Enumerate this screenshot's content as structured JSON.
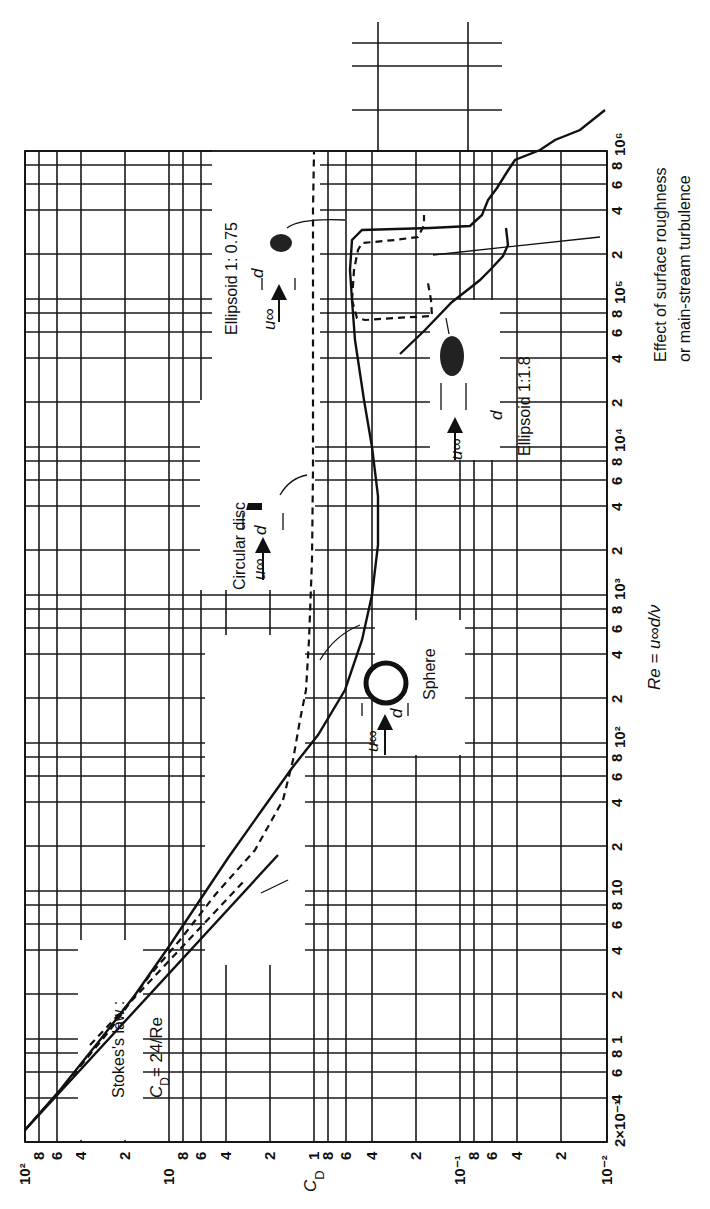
{
  "chart_data": {
    "type": "line",
    "orientation": "rotated-90-ccw",
    "title": "",
    "xlabel": "Re = u∞d/ν",
    "ylabel": "C_D",
    "xscale": "log",
    "yscale": "log",
    "xlim": [
      0.2,
      1000000
    ],
    "ylim": [
      0.01,
      100
    ],
    "grid": true,
    "legend": "none (curves labeled by inline annotations)",
    "x_tick_labels": [
      "2×10⁻¹",
      "4",
      "6",
      "8",
      "1",
      "2",
      "4",
      "6",
      "8",
      "10",
      "2",
      "4",
      "6",
      "8",
      "10²",
      "2",
      "4",
      "6",
      "8",
      "10³",
      "2",
      "4",
      "6",
      "8",
      "10⁴",
      "2",
      "4",
      "6",
      "8",
      "10⁵",
      "2",
      "4",
      "6",
      "8",
      "10⁶"
    ],
    "y_tick_labels": [
      "10²",
      "8",
      "6",
      "4",
      "2",
      "10",
      "8",
      "6",
      "4",
      "2",
      "1",
      "8",
      "6",
      "4",
      "2",
      "10⁻¹",
      "8",
      "6",
      "4",
      "2",
      "10⁻²"
    ],
    "series": [
      {
        "name": "Sphere",
        "style": "solid",
        "x": [
          0.2,
          0.5,
          1,
          2,
          5,
          10,
          20,
          50,
          100,
          200,
          500,
          1000,
          2000,
          5000,
          10000,
          20000,
          50000,
          100000,
          200000,
          250000,
          300000,
          400000,
          500000,
          1000000
        ],
        "y": [
          120,
          50,
          26,
          14,
          7,
          4.2,
          2.7,
          1.6,
          1.1,
          0.8,
          0.55,
          0.47,
          0.42,
          0.39,
          0.4,
          0.43,
          0.47,
          0.48,
          0.46,
          0.35,
          0.15,
          0.09,
          0.1,
          0.15
        ]
      },
      {
        "name": "Circular disc",
        "style": "dashed",
        "x": [
          0.2,
          1,
          5,
          10,
          20,
          50,
          100,
          300,
          1000,
          10000,
          100000,
          1000000
        ],
        "y": [
          120,
          25,
          6,
          3.5,
          2.3,
          1.6,
          1.3,
          1.15,
          1.12,
          1.12,
          1.12,
          1.12
        ]
      },
      {
        "name": "Ellipsoid 1:0.75",
        "style": "dashed",
        "x": [
          60000,
          80000,
          100000,
          150000,
          200000,
          300000,
          400000
        ],
        "y": [
          0.6,
          0.58,
          0.4,
          0.22,
          0.2,
          0.2,
          0.21
        ]
      },
      {
        "name": "Ellipsoid 1:1.8",
        "style": "solid/dashed",
        "x": [
          30000,
          50000,
          70000,
          100000,
          150000,
          200000
        ],
        "y": [
          0.2,
          0.14,
          0.12,
          0.1,
          0.09,
          0.08
        ]
      },
      {
        "name": "Stokes's law C_D = 24/Re",
        "style": "solid",
        "x": [
          0.2,
          1,
          10,
          20
        ],
        "y": [
          120,
          24,
          2.4,
          1.2
        ]
      }
    ],
    "annotations": [
      "Stokes's law :",
      "C_D = 24/Re",
      "Sphere",
      "Circular disc",
      "Ellipsoid 1: 0.75",
      "Ellipsoid 1:1.8",
      "Effect of surface roughness",
      "or main-stream turbulence"
    ]
  },
  "labels": {
    "xlabel": "Re = u∞d/ν",
    "ylabel": "C",
    "ylabel_sub": "D",
    "stokes_line1": "Stokes's law :",
    "stokes_line2": "C",
    "stokes_sub": "D",
    "stokes_eq": "= 24/Re",
    "sphere": "Sphere",
    "disc": "Circular disc",
    "ellipsoid_075": "Ellipsoid 1: 0.75",
    "ellipsoid_18": "Ellipsoid 1:1.8",
    "roughness_line1": "Effect of surface roughness",
    "roughness_line2": "or main-stream turbulence",
    "u_inf": "u∞",
    "d": "d"
  },
  "re_ticks": [
    {
      "label": "2×10⁻¹",
      "y": 1142
    },
    {
      "label": "4",
      "y": 1098
    },
    {
      "label": "6",
      "y": 1072
    },
    {
      "label": "8",
      "y": 1053
    },
    {
      "label": "1",
      "y": 1039
    },
    {
      "label": "2",
      "y": 994
    },
    {
      "label": "4",
      "y": 950
    },
    {
      "label": "6",
      "y": 924
    },
    {
      "label": "8",
      "y": 905
    },
    {
      "label": "10",
      "y": 891
    },
    {
      "label": "2",
      "y": 846
    },
    {
      "label": "4",
      "y": 802
    },
    {
      "label": "6",
      "y": 776
    },
    {
      "label": "8",
      "y": 757
    },
    {
      "label": "10²",
      "y": 743
    },
    {
      "label": "2",
      "y": 698
    },
    {
      "label": "4",
      "y": 654
    },
    {
      "label": "6",
      "y": 628
    },
    {
      "label": "8",
      "y": 609
    },
    {
      "label": "10³",
      "y": 595
    },
    {
      "label": "2",
      "y": 550
    },
    {
      "label": "4",
      "y": 506
    },
    {
      "label": "6",
      "y": 480
    },
    {
      "label": "8",
      "y": 461
    },
    {
      "label": "10⁴",
      "y": 447
    },
    {
      "label": "2",
      "y": 402
    },
    {
      "label": "4",
      "y": 358
    },
    {
      "label": "6",
      "y": 332
    },
    {
      "label": "8",
      "y": 313
    },
    {
      "label": "10⁵",
      "y": 299
    },
    {
      "label": "2",
      "y": 254
    },
    {
      "label": "4",
      "y": 210
    },
    {
      "label": "6",
      "y": 184
    },
    {
      "label": "8",
      "y": 165
    },
    {
      "label": "10⁶",
      "y": 151
    }
  ],
  "cd_ticks": [
    {
      "label": "10²",
      "x": 25
    },
    {
      "label": "8",
      "x": 39
    },
    {
      "label": "6",
      "x": 57
    },
    {
      "label": "4",
      "x": 81
    },
    {
      "label": "2",
      "x": 125
    },
    {
      "label": "10",
      "x": 169
    },
    {
      "label": "8",
      "x": 183
    },
    {
      "label": "6",
      "x": 201
    },
    {
      "label": "4",
      "x": 226
    },
    {
      "label": "2",
      "x": 270
    },
    {
      "label": "1",
      "x": 314
    },
    {
      "label": "8",
      "x": 328
    },
    {
      "label": "6",
      "x": 346
    },
    {
      "label": "4",
      "x": 372
    },
    {
      "label": "2",
      "x": 416
    },
    {
      "label": "10⁻¹",
      "x": 460
    },
    {
      "label": "8",
      "x": 474
    },
    {
      "label": "6",
      "x": 492
    },
    {
      "label": "4",
      "x": 517
    },
    {
      "label": "2",
      "x": 561
    },
    {
      "label": "10⁻²",
      "x": 607
    }
  ]
}
